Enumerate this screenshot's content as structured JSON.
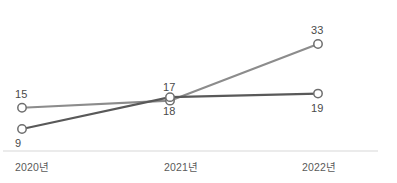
{
  "chart_data": {
    "type": "line",
    "title": "",
    "subtitle": "",
    "xlabel": "",
    "ylabel": "",
    "categories": [
      "2020년",
      "2021년",
      "2022년"
    ],
    "grid": false,
    "legend": "none",
    "ylim": [
      0,
      36
    ],
    "series": [
      {
        "name": "series-a",
        "color": "#8c8c8c",
        "values": [
          15,
          17,
          33
        ],
        "label_positions": [
          "above",
          "above",
          "above"
        ]
      },
      {
        "name": "series-b",
        "color": "#595959",
        "values": [
          9,
          18,
          19
        ],
        "label_positions": [
          "below",
          "below",
          "below"
        ]
      }
    ],
    "marker": {
      "shape": "circle",
      "fill": "#ffffff",
      "stroke": "#6e6e6e",
      "radius": 4.2
    },
    "axis": {
      "baseline_color": "#d8d8d8",
      "baseline_visible": true
    }
  },
  "labels": {
    "s0p0": "15",
    "s0p1": "17",
    "s0p2": "33",
    "s1p0": "9",
    "s1p1": "18",
    "s1p2": "19"
  },
  "axis_ticks": {
    "t0": "2020년",
    "t1": "2021년",
    "t2": "2022년"
  }
}
